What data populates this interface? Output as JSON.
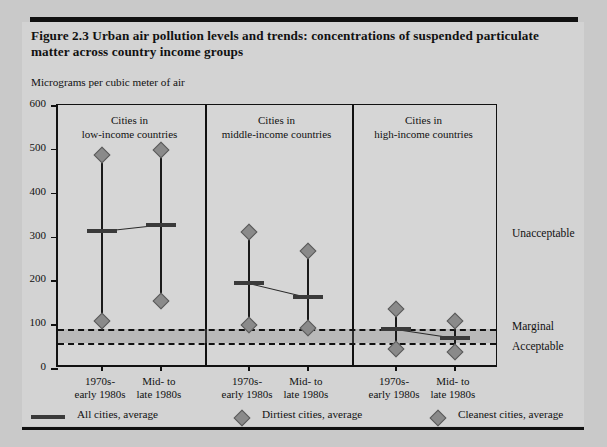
{
  "figure": {
    "title": "Figure 2.3  Urban air pollution levels and trends: concentrations of suspended particulate matter across country income groups",
    "axis_caption": "Micrograms per cubic meter of air"
  },
  "groups": [
    {
      "header_line1": "Cities in",
      "header_line2": "low-income countries"
    },
    {
      "header_line1": "Cities in",
      "header_line2": "middle-income countries"
    },
    {
      "header_line1": "Cities in",
      "header_line2": "high-income countries"
    }
  ],
  "x_categories": [
    {
      "line1": "1970s-",
      "line2": "early 1980s"
    },
    {
      "line1": "Mid- to",
      "line2": "late 1980s"
    },
    {
      "line1": "1970s-",
      "line2": "early 1980s"
    },
    {
      "line1": "Mid- to",
      "line2": "late 1980s"
    },
    {
      "line1": "1970s-",
      "line2": "early 1980s"
    },
    {
      "line1": "Mid- to",
      "line2": "late 1980s"
    }
  ],
  "y_ticks": [
    "600",
    "500",
    "400",
    "300",
    "200",
    "100",
    "0"
  ],
  "thresholds": [
    {
      "label": "Unacceptable",
      "value": 90
    },
    {
      "label": "Marginal",
      "value": 90
    },
    {
      "label": "Acceptable",
      "value": 58
    }
  ],
  "legend": [
    {
      "label": "All cities, average",
      "marker": "line"
    },
    {
      "label": "Dirtiest cities, average",
      "marker": "diamond"
    },
    {
      "label": "Cleanest cities, average",
      "marker": "diamond"
    }
  ],
  "chart_data": {
    "type": "line",
    "title": "Figure 2.3  Urban air pollution levels and trends: concentrations of suspended particulate matter across country income groups",
    "xlabel": "",
    "ylabel": "Micrograms per cubic meter of air",
    "ylim": [
      0,
      600
    ],
    "yticks": [
      0,
      100,
      200,
      300,
      400,
      500,
      600
    ],
    "grid": false,
    "legend_position": "bottom",
    "categories": [
      "low-income / 1970s-early 1980s",
      "low-income / Mid- to late 1980s",
      "middle-income / 1970s-early 1980s",
      "middle-income / Mid- to late 1980s",
      "high-income / 1970s-early 1980s",
      "high-income / Mid- to late 1980s"
    ],
    "series": [
      {
        "name": "All cities, average",
        "values": [
          312,
          327,
          195,
          163,
          88,
          68
        ]
      },
      {
        "name": "Dirtiest cities, average",
        "values": [
          487,
          497,
          310,
          268,
          135,
          108
        ]
      },
      {
        "name": "Cleanest cities, average",
        "values": [
          108,
          152,
          97,
          92,
          44,
          37
        ]
      }
    ],
    "threshold_lines": [
      {
        "label": "Marginal",
        "value": 90
      },
      {
        "label": "Acceptable",
        "value": 58
      }
    ],
    "annotations": [
      "Unacceptable",
      "Marginal",
      "Acceptable"
    ],
    "group_panels": [
      "Cities in low-income countries",
      "Cities in middle-income countries",
      "Cities in high-income countries"
    ]
  }
}
